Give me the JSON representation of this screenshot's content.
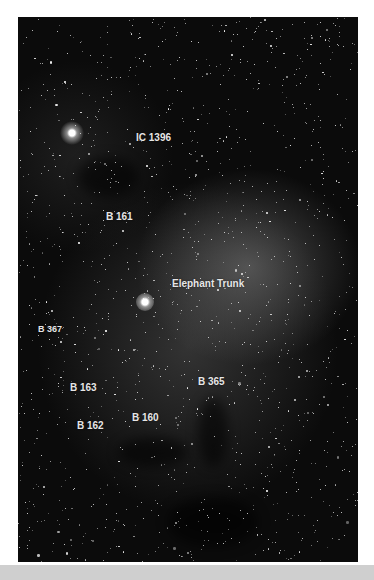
{
  "image": {
    "subject": "IC 1396 nebula star field",
    "labels": [
      {
        "id": "ic1396",
        "text": "IC 1396",
        "x": 136,
        "y": 132
      },
      {
        "id": "b161",
        "text": "B 161",
        "x": 106,
        "y": 211
      },
      {
        "id": "elephant-trunk",
        "text": "Elephant Trunk",
        "x": 172,
        "y": 278
      },
      {
        "id": "b367",
        "text": "B 367",
        "x": 38,
        "y": 324
      },
      {
        "id": "b163",
        "text": "B 163",
        "x": 70,
        "y": 382
      },
      {
        "id": "b365",
        "text": "B 365",
        "x": 198,
        "y": 376
      },
      {
        "id": "b160",
        "text": "B 160",
        "x": 132,
        "y": 412
      },
      {
        "id": "b162",
        "text": "B 162",
        "x": 77,
        "y": 420
      }
    ]
  },
  "colors": {
    "background": "#ffffff",
    "sky": "#0b0b0b",
    "label": "#e6e6e6",
    "footer": "#cfcfcf"
  }
}
